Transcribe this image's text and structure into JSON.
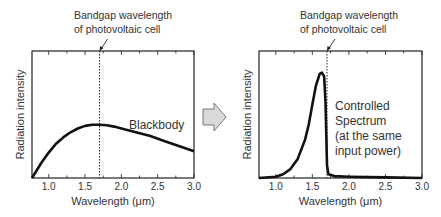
{
  "arrow": {
    "icon": "right-arrow-icon",
    "fill": "#d9d9d9",
    "stroke": "#777777"
  },
  "chart_data": [
    {
      "type": "line",
      "title": "",
      "annotation": [
        "Bandgap wavelength",
        "of photovoltaic cell"
      ],
      "bandgap_x": 1.7,
      "series": [
        {
          "name": "Blackbody",
          "label": "Blackbody",
          "x": [
            0.77,
            0.9,
            1.0,
            1.1,
            1.2,
            1.3,
            1.4,
            1.5,
            1.6,
            1.7,
            1.8,
            1.9,
            2.0,
            2.2,
            2.4,
            2.6,
            2.8,
            3.0
          ],
          "y": [
            0.0,
            0.12,
            0.2,
            0.27,
            0.32,
            0.36,
            0.39,
            0.41,
            0.42,
            0.42,
            0.415,
            0.405,
            0.39,
            0.36,
            0.33,
            0.29,
            0.25,
            0.21
          ]
        }
      ],
      "xlabel": "Wavelength (μm)",
      "ylabel": "Radiation intensity",
      "xticks": [
        "1.0",
        "1.5",
        "2.0",
        "2.5",
        "3.0"
      ],
      "xlim": [
        0.77,
        3.0
      ],
      "ylim": [
        0,
        1
      ]
    },
    {
      "type": "line",
      "title": "",
      "annotation": [
        "Bandgap wavelength",
        "of photovoltaic cell"
      ],
      "bandgap_x": 1.7,
      "series": [
        {
          "name": "Controlled Spectrum",
          "label": [
            "Controlled",
            "Spectrum",
            "(at the same",
            "input power)"
          ],
          "x": [
            0.77,
            1.0,
            1.1,
            1.2,
            1.3,
            1.4,
            1.45,
            1.5,
            1.55,
            1.6,
            1.63,
            1.66,
            1.68,
            1.7,
            1.72,
            1.8,
            2.0,
            2.5,
            3.0
          ],
          "y": [
            0.0,
            0.01,
            0.03,
            0.07,
            0.15,
            0.3,
            0.42,
            0.58,
            0.73,
            0.82,
            0.83,
            0.8,
            0.6,
            0.1,
            0.03,
            0.015,
            0.01,
            0.005,
            0.0
          ]
        }
      ],
      "xlabel": "Wavelength (μm)",
      "ylabel": "Radiation intensity",
      "xticks": [
        "1.0",
        "1.5",
        "2.0",
        "2.5",
        "3.0"
      ],
      "xlim": [
        0.77,
        3.0
      ],
      "ylim": [
        0,
        1
      ]
    }
  ]
}
